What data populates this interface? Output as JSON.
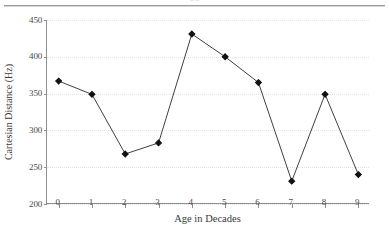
{
  "top_strip": {
    "cut_off_caption": "n n",
    "rule_color": "#9a9a9a"
  },
  "figure": {
    "background": "#ffffff",
    "axis_color": "#8e8e8e",
    "grid_color": "#e4e4e4",
    "series_color": "#404040",
    "marker_color": "#111111"
  },
  "chart_data": {
    "type": "line",
    "title": "",
    "subtitle": "",
    "xlabel": "Age in Decades",
    "ylabel": "Cartesian Distance (Hz)",
    "x": [
      0,
      1,
      2,
      3,
      4,
      5,
      6,
      7,
      8,
      9
    ],
    "xtick_labels": [
      "0",
      "1",
      "2",
      "3",
      "4",
      "5",
      "6",
      "7",
      "8",
      "9"
    ],
    "ytick_labels": [
      "200",
      "250",
      "300",
      "350",
      "400",
      "450"
    ],
    "yticks": [
      200,
      250,
      300,
      350,
      400,
      450
    ],
    "xlim": [
      -0.35,
      9.35
    ],
    "ylim": [
      200,
      450
    ],
    "grid": "horizontal-dotted",
    "legend": "none",
    "marker": "filled-diamond",
    "series": [
      {
        "name": "Cartesian Distance",
        "values": [
          367,
          349,
          268,
          283,
          431,
          400,
          365,
          231,
          349,
          240
        ]
      }
    ]
  }
}
